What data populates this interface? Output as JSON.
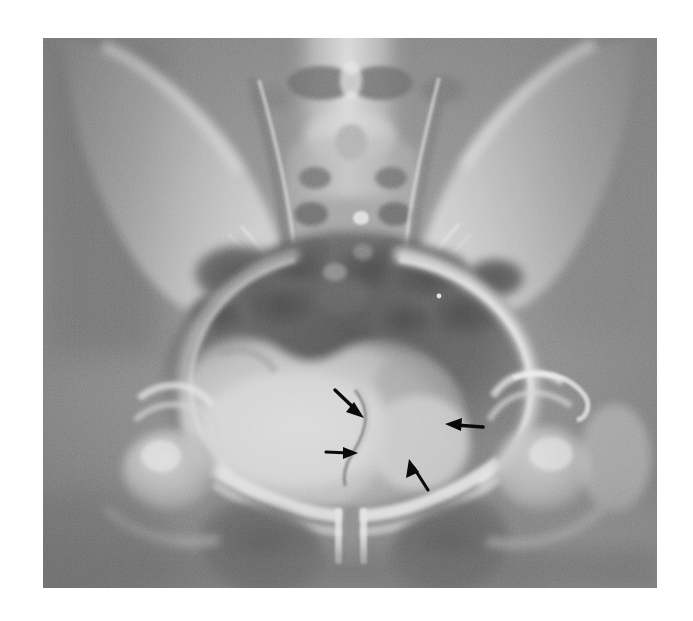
{
  "image": {
    "modality": "radiograph",
    "view": "AP pelvis",
    "colorspace": "grayscale",
    "canvas": {
      "width": 693,
      "height": 621,
      "background": "#ffffff"
    },
    "plate": {
      "x": 43,
      "y": 38,
      "width": 614,
      "height": 550
    },
    "tones": {
      "border": "#ffffff",
      "soft_tissue_dark": "#6d6d6d",
      "soft_tissue_mid": "#8d8d8d",
      "bone_light": "#cfcfcf",
      "bone_bright": "#e6e6e6",
      "bowel_gas_dark": "#555555",
      "bladder_bright": "#d8d8d8",
      "annotation": "#0a0a0a"
    }
  },
  "anatomy": {
    "structures": [
      {
        "name": "lumbar-spine",
        "label": "Lower lumbar vertebrae"
      },
      {
        "name": "sacrum",
        "label": "Sacrum with sacral foramina"
      },
      {
        "name": "sacroiliac-joint-left",
        "label": "Left sacroiliac joint"
      },
      {
        "name": "sacroiliac-joint-right",
        "label": "Right sacroiliac joint"
      },
      {
        "name": "iliac-wing-left",
        "label": "Left iliac wing"
      },
      {
        "name": "iliac-wing-right",
        "label": "Right iliac wing"
      },
      {
        "name": "pelvic-brim",
        "label": "Pelvic brim / iliopectineal line"
      },
      {
        "name": "acetabulum-left",
        "label": "Left acetabulum"
      },
      {
        "name": "acetabulum-right",
        "label": "Right acetabulum"
      },
      {
        "name": "femoral-head-left",
        "label": "Left femoral head"
      },
      {
        "name": "femoral-head-right",
        "label": "Right femoral head"
      },
      {
        "name": "obturator-foramen-left",
        "label": "Left obturator foramen"
      },
      {
        "name": "obturator-foramen-right",
        "label": "Right obturator foramen"
      },
      {
        "name": "pubic-symphysis",
        "label": "Pubic symphysis"
      },
      {
        "name": "superior-pubic-ramus",
        "label": "Superior pubic rami"
      },
      {
        "name": "bladder",
        "label": "Opacified urinary bladder"
      },
      {
        "name": "bowel-gas",
        "label": "Overlying bowel gas shadows"
      },
      {
        "name": "bladder-indentation",
        "label": "Extrinsic indentation of right bladder wall"
      }
    ]
  },
  "annotations": {
    "color": "#0a0a0a",
    "count": 4,
    "arrows": [
      {
        "id": "arrow-1",
        "name": "arrow-upper-left-pointing-down-right",
        "direction": "down-right",
        "tail": {
          "x": 292,
          "y": 352
        },
        "head": {
          "x": 317,
          "y": 376
        },
        "target": "Superior margin of bladder indentation"
      },
      {
        "id": "arrow-2",
        "name": "arrow-lower-left-pointing-right",
        "direction": "right",
        "tail": {
          "x": 283,
          "y": 414
        },
        "head": {
          "x": 311,
          "y": 415
        },
        "target": "Inferomedial margin of bladder indentation"
      },
      {
        "id": "arrow-3",
        "name": "arrow-right-pointing-left",
        "direction": "left",
        "tail": {
          "x": 438,
          "y": 388
        },
        "head": {
          "x": 406,
          "y": 386
        },
        "target": "Lateral margin of the mass"
      },
      {
        "id": "arrow-4",
        "name": "arrow-lower-right-pointing-up-left",
        "direction": "up-left",
        "tail": {
          "x": 385,
          "y": 452
        },
        "head": {
          "x": 368,
          "y": 424
        },
        "target": "Inferolateral margin of the mass"
      }
    ]
  }
}
